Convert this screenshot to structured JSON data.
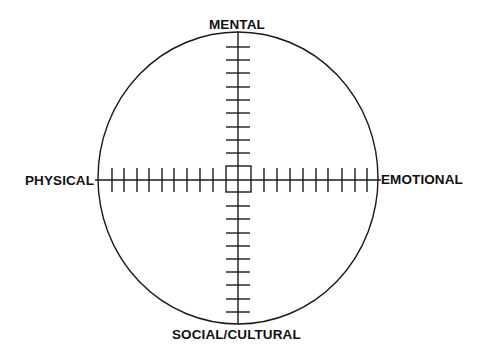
{
  "diagram": {
    "type": "circular quadrant diagram with crosshair axes",
    "labels": {
      "top": "MENTAL",
      "left": "PHYSICAL",
      "right": "EMOTIONAL",
      "bottom": "SOCIAL/CULTURAL"
    },
    "center": {
      "x": 238,
      "y": 179
    },
    "circle": {
      "rx": 140,
      "ry": 146
    },
    "center_box": {
      "x": 226,
      "y": 166,
      "width": 25,
      "height": 26
    },
    "ticks": {
      "per_arm": 9,
      "tick_half_length": 12,
      "top_y": [
        47,
        60,
        73,
        87,
        100,
        113,
        127,
        140,
        153
      ],
      "bottom_y": [
        206,
        219,
        233,
        246,
        259,
        272,
        285,
        299,
        312
      ],
      "left_x": [
        112,
        124,
        137,
        149,
        162,
        174,
        187,
        200,
        213
      ],
      "right_x": [
        264,
        277,
        290,
        303,
        316,
        328,
        342,
        355,
        367
      ]
    },
    "colors": {
      "line": "#1a1a1a",
      "background": "#ffffff",
      "text": "#111111"
    }
  }
}
